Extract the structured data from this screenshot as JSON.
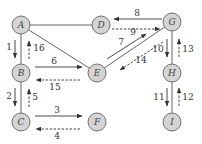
{
  "nodes": [
    {
      "id": "A",
      "label": "A",
      "x": 21,
      "y": 25
    },
    {
      "id": "D",
      "label": "D",
      "x": 101,
      "y": 25
    },
    {
      "id": "G",
      "label": "G",
      "x": 172,
      "y": 22
    },
    {
      "id": "B",
      "label": "B",
      "x": 21,
      "y": 73
    },
    {
      "id": "E",
      "label": "E",
      "x": 97,
      "y": 73
    },
    {
      "id": "H",
      "label": "H",
      "x": 172,
      "y": 73
    },
    {
      "id": "C",
      "label": "C",
      "x": 21,
      "y": 122
    },
    {
      "id": "F",
      "label": "F",
      "x": 97,
      "y": 122
    },
    {
      "id": "I",
      "label": "I",
      "x": 172,
      "y": 122
    }
  ],
  "edges": [
    [
      "A",
      "D"
    ],
    [
      "A",
      "B"
    ],
    [
      "A",
      "E"
    ],
    [
      "B",
      "E"
    ],
    [
      "B",
      "C"
    ],
    [
      "C",
      "F"
    ],
    [
      "D",
      "G"
    ],
    [
      "G",
      "E"
    ],
    [
      "G",
      "H"
    ],
    [
      "H",
      "I"
    ]
  ],
  "steps": [
    {
      "n": "1",
      "from": "A",
      "to": "B",
      "style": "solid"
    },
    {
      "n": "2",
      "from": "B",
      "to": "C",
      "style": "solid"
    },
    {
      "n": "3",
      "from": "C",
      "to": "F",
      "style": "solid"
    },
    {
      "n": "4",
      "from": "F",
      "to": "C",
      "style": "dashed"
    },
    {
      "n": "5",
      "from": "C",
      "to": "B",
      "style": "dashed"
    },
    {
      "n": "6",
      "from": "B",
      "to": "E",
      "style": "solid"
    },
    {
      "n": "7",
      "from": "E",
      "to": "G",
      "style": "solid"
    },
    {
      "n": "8",
      "from": "G",
      "to": "D",
      "style": "solid"
    },
    {
      "n": "9",
      "from": "D",
      "to": "G",
      "style": "dashed"
    },
    {
      "n": "10",
      "from": "G",
      "to": "H",
      "style": "solid"
    },
    {
      "n": "11",
      "from": "H",
      "to": "I",
      "style": "solid"
    },
    {
      "n": "12",
      "from": "I",
      "to": "H",
      "style": "dashed"
    },
    {
      "n": "13",
      "from": "H",
      "to": "G",
      "style": "dashed"
    },
    {
      "n": "14",
      "from": "G",
      "to": "E",
      "style": "dashed"
    },
    {
      "n": "15",
      "from": "E",
      "to": "B",
      "style": "dashed"
    },
    {
      "n": "16",
      "from": "B",
      "to": "A",
      "style": "dashed"
    }
  ]
}
